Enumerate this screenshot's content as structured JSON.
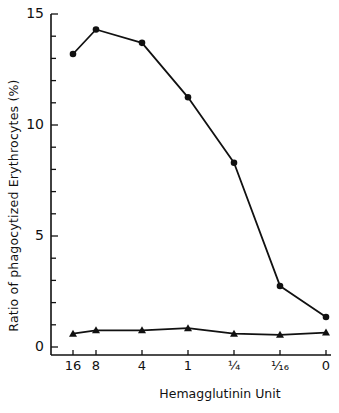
{
  "chart_data": {
    "type": "line",
    "title": "",
    "xlabel": "Hemagglutinin Unit",
    "ylabel": "Ratio of phagocytized Erythrocytes (%)",
    "categories": [
      "16",
      "8",
      "4",
      "1",
      "1/4",
      "1/16",
      "0"
    ],
    "x_tick_labels": [
      "16",
      "8",
      "4",
      "1",
      "¼",
      "1⁄16",
      "0"
    ],
    "y_ticks": [
      0,
      5,
      10,
      15
    ],
    "y_minor_tick_step": 1,
    "ylim": [
      0,
      15
    ],
    "grid": false,
    "legend": "none",
    "series": [
      {
        "name": "circles",
        "marker": "circle",
        "values": [
          13.2,
          14.3,
          13.7,
          11.25,
          8.3,
          2.75,
          1.35
        ]
      },
      {
        "name": "triangles",
        "marker": "triangle",
        "values": [
          0.6,
          0.75,
          0.75,
          0.85,
          0.6,
          0.55,
          0.65
        ]
      }
    ]
  },
  "labels": {
    "y_axis": "Ratio of phagocytized Erythrocytes (%)",
    "x_axis": "Hemagglutinin Unit",
    "y_ticks": [
      "0",
      "5",
      "10",
      "15"
    ],
    "x_ticks": [
      "16",
      "8",
      "4",
      "1",
      "¼",
      "¹⁄₁₆",
      "0"
    ]
  }
}
